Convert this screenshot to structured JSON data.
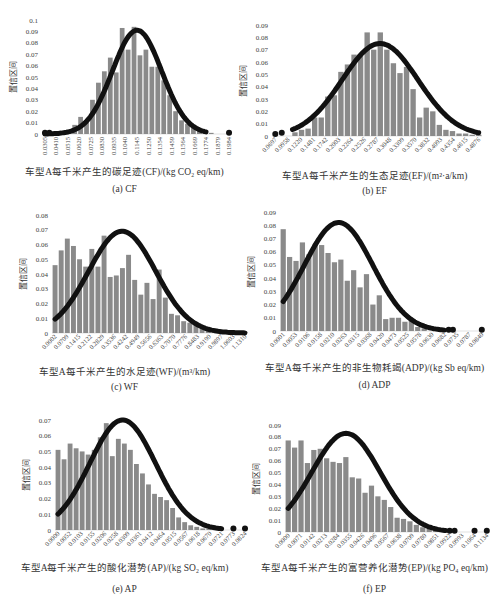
{
  "chart_data": [
    {
      "id": "cf",
      "type": "bar",
      "title": "(a) CF",
      "xlabel": "车型A每千米产生的碳足迹(CF)/(kg CO₂ eq/km)",
      "ylabel": "置信区间",
      "ylim": [
        0,
        0.1
      ],
      "yticks": [
        "0",
        "0.01",
        "0.02",
        "0.03",
        "0.04",
        "0.05",
        "0.06",
        "0.07",
        "0.08",
        "0.09",
        "0.1"
      ],
      "x_tick_rotation": 90,
      "categories": [
        "0.0305",
        "0.0410",
        "0.0515",
        "0.0620",
        "0.0725",
        "0.0830",
        "0.0935",
        "0.1040",
        "0.1145",
        "0.1250",
        "0.1354",
        "0.1459",
        "0.1564",
        "0.1669",
        "0.1774",
        "0.1879",
        "0.1984"
      ],
      "values": [
        0.0,
        0.0,
        0.001,
        0.0,
        0.001,
        0.008,
        0.015,
        0.01,
        0.03,
        0.045,
        0.055,
        0.067,
        0.054,
        0.093,
        0.074,
        0.094,
        0.069,
        0.074,
        0.059,
        0.059,
        0.047,
        0.034,
        0.02,
        0.012,
        0.009,
        0.006,
        0.004,
        0.002,
        0.001,
        0.0,
        0.0,
        0.0
      ],
      "normal_fit": {
        "mean": 0.1145,
        "sd": 0.0225,
        "peak": 0.091,
        "x_start": 0.0305,
        "x_end": 0.1774
      },
      "outlier_dots": [
        0.0305,
        0.0345,
        0.1984
      ],
      "grid": false
    },
    {
      "id": "ef",
      "type": "bar",
      "title": "(b) EF",
      "xlabel": "车型A每千米产生的生态足迹(EF)/(m²·a/km)",
      "ylabel": "置信区间",
      "ylim": [
        0,
        0.09
      ],
      "yticks": [
        "0",
        "0.01",
        "0.02",
        "0.03",
        "0.04",
        "0.05",
        "0.06",
        "0.07",
        "0.08",
        "0.09"
      ],
      "x_tick_rotation": 45,
      "categories": [
        "0.0697",
        "0.0958",
        "0.1220",
        "0.1481",
        "0.1742",
        "0.2003",
        "0.2264",
        "0.2526",
        "0.2787",
        "0.3048",
        "0.3309",
        "0.3570",
        "0.3832",
        "0.4093",
        "0.4354",
        "0.4615",
        "0.4876"
      ],
      "values": [
        0.0,
        0.0,
        0.0,
        0.003,
        0.005,
        0.006,
        0.015,
        0.015,
        0.032,
        0.033,
        0.052,
        0.058,
        0.066,
        0.065,
        0.084,
        0.07,
        0.084,
        0.07,
        0.059,
        0.051,
        0.056,
        0.038,
        0.015,
        0.023,
        0.02,
        0.009,
        0.005,
        0.004,
        0.002,
        0.002,
        0.001,
        0.001
      ],
      "normal_fit": {
        "mean": 0.285,
        "sd": 0.078,
        "peak": 0.075,
        "x_start": 0.105,
        "x_end": 0.4876
      },
      "outlier_dots": [
        0.0697,
        0.083
      ],
      "grid": false
    },
    {
      "id": "wf",
      "type": "bar",
      "title": "(c) WF",
      "xlabel": "车型A每千米产生的水足迹(WF)/(m³/km)",
      "ylabel": "置信区间",
      "ylim": [
        0,
        0.08
      ],
      "yticks": [
        "0",
        "0.01",
        "0.02",
        "0.03",
        "0.04",
        "0.05",
        "0.06",
        "0.07",
        "0.08"
      ],
      "x_tick_rotation": 45,
      "categories": [
        "0.0002",
        "0.0709",
        "0.1415",
        "0.2122",
        "0.2829",
        "0.3536",
        "0.4242",
        "0.4949",
        "0.5656",
        "0.6363",
        "0.7070",
        "0.7776",
        "0.8483",
        "0.9190",
        "0.9897",
        "1.0603",
        "1.1310"
      ],
      "values": [
        0.046,
        0.056,
        0.064,
        0.059,
        0.05,
        0.045,
        0.057,
        0.045,
        0.066,
        0.038,
        0.039,
        0.044,
        0.053,
        0.036,
        0.026,
        0.034,
        0.023,
        0.043,
        0.024,
        0.013,
        0.012,
        0.008,
        0.007,
        0.006,
        0.004,
        0.003,
        0.002,
        0.002,
        0.001,
        0.001,
        0.001,
        0.001
      ],
      "normal_fit": {
        "mean": 0.4,
        "sd": 0.2,
        "peak": 0.069,
        "x_start": 0.0002,
        "x_end": 1.131
      },
      "outlier_dots": [],
      "grid": false
    },
    {
      "id": "adp",
      "type": "bar",
      "title": "(d)  ADP",
      "xlabel": "车型A每千米产生的非生物耗竭(ADP)/(kg Sb eq/km)",
      "ylabel": "置信区间",
      "ylim": [
        0,
        0.09
      ],
      "yticks": [
        "0",
        "0.01",
        "0.02",
        "0.03",
        "0.04",
        "0.05",
        "0.06",
        "0.07",
        "0.08",
        "0.09"
      ],
      "x_tick_rotation": 45,
      "categories": [
        "0.0001",
        "0.0053",
        "0.0106",
        "0.0158",
        "0.0210",
        "0.0263",
        "0.0315",
        "0.0368",
        "0.0420",
        "0.0473",
        "0.0525",
        "0.0578",
        "0.0630",
        "0.0682",
        "0.0735",
        "0.0787",
        "0.0840"
      ],
      "values": [
        0.077,
        0.056,
        0.053,
        0.067,
        0.058,
        0.066,
        0.065,
        0.059,
        0.052,
        0.054,
        0.038,
        0.046,
        0.033,
        0.043,
        0.02,
        0.027,
        0.009,
        0.01,
        0.01,
        0.007,
        0.009,
        0.003,
        0.002,
        0.0,
        0.0,
        0.0,
        0.0,
        0.0,
        0.0,
        0.0,
        0.0,
        0.0
      ],
      "normal_fit": {
        "mean": 0.0235,
        "sd": 0.0145,
        "peak": 0.082,
        "x_start": 0.0001,
        "x_end": 0.0682
      },
      "outlier_dots": [
        0.07,
        0.0718,
        0.084
      ],
      "grid": false
    },
    {
      "id": "ap",
      "type": "bar",
      "title": "(e)  AP",
      "xlabel": "车型A每千米产生的酸化潜势(AP)/(kg SO₂ eq/km)",
      "ylabel": "置信区间",
      "ylim": [
        0,
        0.07
      ],
      "yticks": [
        "0",
        "0.01",
        "0.02",
        "0.03",
        "0.04",
        "0.05",
        "0.06",
        "0.07"
      ],
      "x_tick_rotation": 45,
      "categories": [
        "0.0000",
        "0.0052",
        "0.0103",
        "0.0155",
        "0.0206",
        "0.0258",
        "0.0309",
        "0.0361",
        "0.0412",
        "0.0464",
        "0.0515",
        "0.0567",
        "0.0618",
        "0.0670",
        "0.0721",
        "0.0773",
        "0.0824"
      ],
      "values": [
        0.051,
        0.045,
        0.055,
        0.052,
        0.05,
        0.048,
        0.051,
        0.059,
        0.068,
        0.047,
        0.058,
        0.055,
        0.051,
        0.042,
        0.036,
        0.029,
        0.023,
        0.021,
        0.019,
        0.014,
        0.008,
        0.005,
        0.003,
        0.002,
        0.001,
        0.001,
        0.0,
        0.0,
        0.0,
        0.0,
        0.0,
        0.0
      ],
      "normal_fit": {
        "mean": 0.0285,
        "sd": 0.0145,
        "peak": 0.07,
        "x_start": 0.0,
        "x_end": 0.0721
      },
      "outlier_dots": [
        0.0773,
        0.0824
      ],
      "grid": false
    },
    {
      "id": "ep",
      "type": "bar",
      "title": "(f) EP",
      "xlabel": "车型A每千米产生的富营养化潜势(EP)/(kg PO₄ eq/km)",
      "ylabel": "置信区间",
      "ylim": [
        0,
        0.09
      ],
      "yticks": [
        "0",
        "0.01",
        "0.02",
        "0.03",
        "0.04",
        "0.05",
        "0.06",
        "0.07",
        "0.08",
        "0.09"
      ],
      "x_tick_rotation": 45,
      "categories": [
        "0.0000",
        "0.0071",
        "0.0142",
        "0.0213",
        "0.0284",
        "0.0355",
        "0.0426",
        "0.0496",
        "0.0567",
        "0.0638",
        "0.0709",
        "0.0780",
        "0.0851",
        "0.0922",
        "0.0993",
        "0.1064",
        "0.1134"
      ],
      "values": [
        0.077,
        0.071,
        0.077,
        0.058,
        0.069,
        0.07,
        0.062,
        0.059,
        0.058,
        0.063,
        0.046,
        0.045,
        0.033,
        0.039,
        0.03,
        0.027,
        0.021,
        0.012,
        0.011,
        0.009,
        0.006,
        0.004,
        0.003,
        0.002,
        0.002,
        0.001,
        0.0,
        0.0,
        0.0,
        0.0,
        0.0,
        0.0
      ],
      "normal_fit": {
        "mean": 0.033,
        "sd": 0.0195,
        "peak": 0.083,
        "x_start": 0.0,
        "x_end": 0.09
      },
      "outlier_dots": [
        0.0922,
        0.095,
        0.1064,
        0.1134
      ],
      "grid": false
    }
  ]
}
